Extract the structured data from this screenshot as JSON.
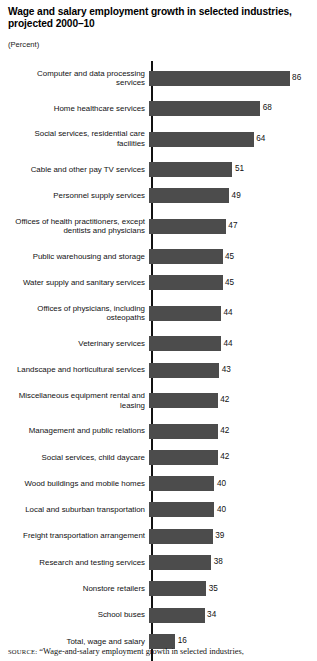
{
  "header": {
    "title": "Wage and salary employment growth in selected industries, projected 2000–10",
    "units": "(Percent)"
  },
  "footer": {
    "source_kicker": "source:",
    "source_text": "“Wage-and-salary employment growth in selected industries,"
  },
  "chart_data": {
    "type": "bar",
    "orientation": "horizontal",
    "title": "Wage and salary employment growth in selected industries, projected 2000–10",
    "subtitle": "(Percent)",
    "xlabel": "Percent",
    "ylabel": "",
    "xlim": [
      0,
      90
    ],
    "grid": false,
    "legend": false,
    "bar_color": "#4c4c4c",
    "axis_color": "#111111",
    "categories": [
      "Computer and data processing services",
      "Home healthcare services",
      "Social services, residential care facilities",
      "Cable and other pay TV services",
      "Personnel supply services",
      "Offices of health practitioners, except dentists and physicians",
      "Public warehousing and storage",
      "Water supply and sanitary services",
      "Offices of physicians, including osteopaths",
      "Veterinary services",
      "Landscape and horticultural services",
      "Miscellaneous equipment rental and leasing",
      "Management and public relations",
      "Social services, child daycare",
      "Wood buildings and mobile homes",
      "Local and suburban transportation",
      "Freight transportation arrangement",
      "Research and testing services",
      "Nonstore retailers",
      "School buses",
      "Total, wage and salary"
    ],
    "values": [
      86,
      68,
      64,
      51,
      49,
      47,
      45,
      45,
      44,
      44,
      43,
      42,
      42,
      42,
      40,
      40,
      39,
      38,
      35,
      34,
      16
    ],
    "bars": [
      {
        "label": "Computer and data processing services",
        "label_lines": [
          "Computer and data processing",
          "services"
        ],
        "value": 86
      },
      {
        "label": "Home healthcare services",
        "label_lines": [
          "Home healthcare services"
        ],
        "value": 68
      },
      {
        "label": "Social services, residential care facilities",
        "label_lines": [
          "Social services, residential care",
          "facilities"
        ],
        "value": 64
      },
      {
        "label": "Cable and other pay TV services",
        "label_lines": [
          "Cable and other pay TV services"
        ],
        "value": 51
      },
      {
        "label": "Personnel supply services",
        "label_lines": [
          "Personnel supply services"
        ],
        "value": 49
      },
      {
        "label": "Offices of health practitioners, except dentists and physicians",
        "label_lines": [
          "Offices of health practitioners, except",
          "dentists and physicians"
        ],
        "value": 47
      },
      {
        "label": "Public warehousing and storage",
        "label_lines": [
          "Public warehousing and storage"
        ],
        "value": 45
      },
      {
        "label": "Water supply and sanitary services",
        "label_lines": [
          "Water supply and sanitary services"
        ],
        "value": 45
      },
      {
        "label": "Offices of physicians, including osteopaths",
        "label_lines": [
          "Offices of physicians, including",
          "osteopaths"
        ],
        "value": 44
      },
      {
        "label": "Veterinary services",
        "label_lines": [
          "Veterinary services"
        ],
        "value": 44
      },
      {
        "label": "Landscape and horticultural services",
        "label_lines": [
          "Landscape and horticultural services"
        ],
        "value": 43
      },
      {
        "label": "Miscellaneous equipment rental and leasing",
        "label_lines": [
          "Miscellaneous equipment rental and",
          "leasing"
        ],
        "value": 42
      },
      {
        "label": "Management and public relations",
        "label_lines": [
          "Management and public relations"
        ],
        "value": 42
      },
      {
        "label": "Social services, child daycare",
        "label_lines": [
          "Social services, child daycare"
        ],
        "value": 42
      },
      {
        "label": "Wood buildings and mobile homes",
        "label_lines": [
          "Wood buildings and mobile homes"
        ],
        "value": 40
      },
      {
        "label": "Local and suburban transportation",
        "label_lines": [
          "Local and suburban transportation"
        ],
        "value": 40
      },
      {
        "label": "Freight transportation arrangement",
        "label_lines": [
          "Freight transportation arrangement"
        ],
        "value": 39
      },
      {
        "label": "Research and testing services",
        "label_lines": [
          "Research and testing services"
        ],
        "value": 38
      },
      {
        "label": "Nonstore retailers",
        "label_lines": [
          "Nonstore retailers"
        ],
        "value": 35
      },
      {
        "label": "School buses",
        "label_lines": [
          "School buses"
        ],
        "value": 34
      },
      {
        "label": "Total, wage and salary",
        "label_lines": [
          "Total, wage and salary"
        ],
        "value": 16
      }
    ]
  }
}
